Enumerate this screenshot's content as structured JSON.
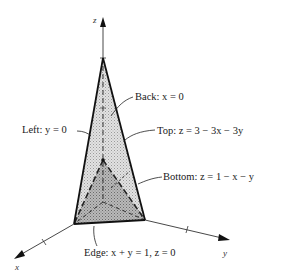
{
  "diagram": {
    "axes": {
      "x": {
        "label": "x"
      },
      "y": {
        "label": "y"
      },
      "z": {
        "label": "z"
      }
    },
    "vertices": {
      "origin": [
        0,
        0,
        0
      ],
      "x_base": [
        1,
        0,
        0
      ],
      "y_base": [
        0,
        1,
        0
      ],
      "z_top": [
        0,
        0,
        3
      ],
      "z_bottom": [
        0,
        0,
        1
      ]
    },
    "labels": {
      "back": "Back: x = 0",
      "left": "Left: y = 0",
      "top": "Top: z = 3 − 3x − 3y",
      "bottom": "Bottom: z = 1 − x − y",
      "edge": "Edge: x + y = 1, z = 0"
    },
    "colors": {
      "outline": "#111111",
      "top_face_fill": "#d4d4d4",
      "bottom_face_fill": "#a8a8a8",
      "axis": "#333333",
      "leader": "#222222"
    }
  }
}
